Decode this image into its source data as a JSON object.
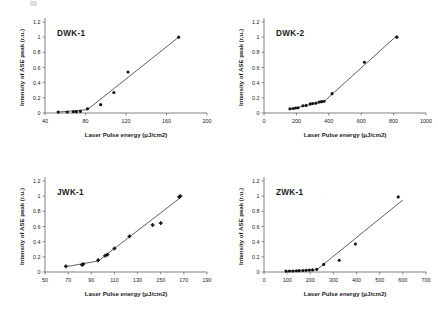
{
  "figure": {
    "background_color": "#ffffff",
    "ink_color": "#111111",
    "layout": "2x2 grid of scatter plots"
  },
  "common": {
    "xlabel": "Laser Pulse energy (μJ/cm2)",
    "ylabel": "Intensity of ASE peak (r.u.)",
    "ylim": [
      0,
      1.2
    ],
    "yticks": [
      "0",
      "0.2",
      "0.4",
      "0.6",
      "0.8",
      "1",
      "1.2"
    ],
    "ytick_values": [
      0,
      0.2,
      0.4,
      0.6,
      0.8,
      1,
      1.2
    ]
  },
  "chart_data": [
    {
      "type": "scatter",
      "title": "DWK-1",
      "xlabel": "Laser Pulse energy (μJ/cm2)",
      "ylabel": "Intensity of ASE peak (r.u.)",
      "xlim": [
        40,
        200
      ],
      "ylim": [
        0,
        1.2
      ],
      "xticks": [
        "40",
        "80",
        "120",
        "160",
        "200"
      ],
      "xtick_values": [
        40,
        80,
        120,
        160,
        200
      ],
      "ytick_values": [
        0,
        0.2,
        0.4,
        0.6,
        0.8,
        1,
        1.2
      ],
      "grid": false,
      "legend": "none",
      "marker": "filled-circle",
      "x": [
        53,
        62,
        68,
        71,
        75,
        82,
        95,
        108,
        122,
        172
      ],
      "y": [
        0.012,
        0.014,
        0.016,
        0.018,
        0.022,
        0.055,
        0.11,
        0.27,
        0.54,
        1.0
      ],
      "fit_line": {
        "x": [
          53,
          82,
          172
        ],
        "y": [
          0.012,
          0.045,
          1.0
        ]
      }
    },
    {
      "type": "scatter",
      "title": "DWK-2",
      "xlabel": "Laser Pulse energy (μJ/cm2)",
      "ylabel": "Intensity of ASE peak (r.u.)",
      "xlim": [
        0,
        1000
      ],
      "ylim": [
        0,
        1.2
      ],
      "xticks": [
        "0",
        "200",
        "400",
        "600",
        "800",
        "1000"
      ],
      "xtick_values": [
        0,
        200,
        400,
        600,
        800,
        1000
      ],
      "ytick_values": [
        0,
        0.2,
        0.4,
        0.6,
        0.8,
        1,
        1.2
      ],
      "grid": false,
      "legend": "none",
      "marker": "filled-circle",
      "x": [
        160,
        180,
        195,
        210,
        240,
        260,
        285,
        300,
        320,
        340,
        355,
        370,
        420,
        620,
        820
      ],
      "y": [
        0.055,
        0.06,
        0.065,
        0.07,
        0.095,
        0.1,
        0.12,
        0.125,
        0.13,
        0.145,
        0.15,
        0.155,
        0.255,
        0.67,
        1.0
      ],
      "fit_line": {
        "x": [
          160,
          370,
          820
        ],
        "y": [
          0.05,
          0.15,
          1.02
        ]
      }
    },
    {
      "type": "scatter",
      "title": "JWK-1",
      "xlabel": "Laser Pulse energy (μJ/cm2)",
      "ylabel": "Intensity of ASE peak (r.u.)",
      "xlim": [
        50,
        190
      ],
      "ylim": [
        0,
        1.2
      ],
      "xticks": [
        "50",
        "70",
        "90",
        "110",
        "130",
        "150",
        "170",
        "190"
      ],
      "xtick_values": [
        50,
        70,
        90,
        110,
        130,
        150,
        170,
        190
      ],
      "ytick_values": [
        0,
        0.2,
        0.4,
        0.6,
        0.8,
        1,
        1.2
      ],
      "grid": false,
      "legend": "none",
      "marker": "plus",
      "x": [
        68,
        82,
        83,
        96,
        102,
        104,
        110,
        123,
        143,
        150,
        166,
        167
      ],
      "y": [
        0.075,
        0.095,
        0.105,
        0.155,
        0.215,
        0.23,
        0.31,
        0.47,
        0.62,
        0.645,
        0.99,
        1.0
      ],
      "fit_line": {
        "x": [
          68,
          96,
          167
        ],
        "y": [
          0.07,
          0.145,
          0.98
        ]
      }
    },
    {
      "type": "scatter",
      "title": "ZWK-1",
      "xlabel": "Laser Pulse energy (μJ/cm2)",
      "ylabel": "Intensity of ASE peak (r.u.)",
      "xlim": [
        0,
        700
      ],
      "ylim": [
        0,
        1.2
      ],
      "xticks": [
        "0",
        "100",
        "200",
        "300",
        "400",
        "500",
        "600",
        "700"
      ],
      "xtick_values": [
        0,
        100,
        200,
        300,
        400,
        500,
        600,
        700
      ],
      "ytick_values": [
        0,
        0.2,
        0.4,
        0.6,
        0.8,
        1,
        1.2
      ],
      "grid": false,
      "legend": "none",
      "marker": "filled-circle",
      "x": [
        95,
        110,
        125,
        140,
        152,
        168,
        182,
        196,
        210,
        228,
        258,
        325,
        395,
        580
      ],
      "y": [
        0.012,
        0.013,
        0.014,
        0.016,
        0.018,
        0.02,
        0.022,
        0.025,
        0.028,
        0.035,
        0.1,
        0.155,
        0.37,
        0.99
      ],
      "fit_line": {
        "x": [
          95,
          228,
          600
        ],
        "y": [
          0.008,
          0.03,
          0.95
        ]
      }
    }
  ]
}
